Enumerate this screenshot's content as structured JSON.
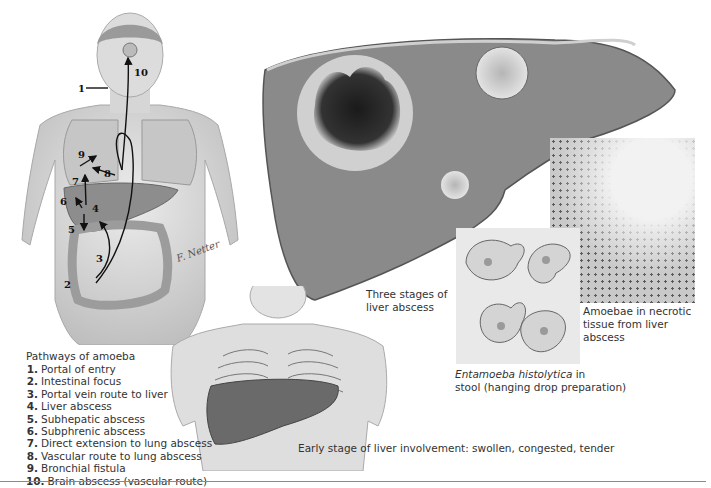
{
  "figure": {
    "signature": "F. Netter",
    "pathway_numbers": [
      "1",
      "2",
      "3",
      "4",
      "5",
      "6",
      "7",
      "8",
      "9",
      "10"
    ]
  },
  "legend": {
    "title": "Pathways of amoeba",
    "items": [
      {
        "num": "1.",
        "label": "Portal of entry"
      },
      {
        "num": "2.",
        "label": "Intestinal focus"
      },
      {
        "num": "3.",
        "label": "Portal vein route to liver"
      },
      {
        "num": "4.",
        "label": "Liver abscess"
      },
      {
        "num": "5.",
        "label": "Subhepatic abscess"
      },
      {
        "num": "6.",
        "label": "Subphrenic abscess"
      },
      {
        "num": "7.",
        "label": "Direct extension to lung abscess"
      },
      {
        "num": "8.",
        "label": "Vascular route  to lung abscess"
      },
      {
        "num": "9.",
        "label": "Bronchial fistula"
      },
      {
        "num": "10.",
        "label": "Brain abscess (vascular route)"
      }
    ]
  },
  "captions": {
    "liver_stages_line1": "Three stages of",
    "liver_stages_line2": "liver abscess",
    "stool_italic": "Entamoeba histolytica",
    "stool_rest1": " in",
    "stool_line2": "stool (hanging drop preparation)",
    "necrotic_line1": "Amoebae in necrotic",
    "necrotic_line2": "tissue from liver abscess",
    "early_stage": "Early stage of liver involvement: swollen, congested, tender"
  },
  "colors": {
    "background": "#ffffff",
    "skin": "#d9d9d9",
    "liver_tissue": "#8c8c8c",
    "abscess_core": "#262626",
    "rule": "#8a8a8a",
    "text": "#333333"
  }
}
